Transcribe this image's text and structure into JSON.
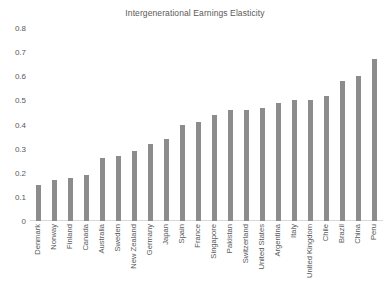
{
  "chart_data": {
    "type": "bar",
    "title": "Intergenerational Earnings Elasticity",
    "xlabel": "",
    "ylabel": "",
    "ylim": [
      0,
      0.8
    ],
    "yticks": [
      "0",
      "0.1",
      "0.2",
      "0.3",
      "0.4",
      "0.5",
      "0.6",
      "0.7",
      "0.8"
    ],
    "ytick_values": [
      0,
      0.1,
      0.2,
      0.3,
      0.4,
      0.5,
      0.6,
      0.7,
      0.8
    ],
    "grid": false,
    "legend": false,
    "bar_color": "#8c8c8c",
    "categories": [
      "Denmark",
      "Norway",
      "Finland",
      "Canada",
      "Australia",
      "Sweden",
      "New Zealand",
      "Germany",
      "Japan",
      "Spain",
      "France",
      "Singapore",
      "Pakistan",
      "Switzerland",
      "United States",
      "Argentina",
      "Italy",
      "United Kingdom",
      "Chile",
      "Brazil",
      "China",
      "Peru"
    ],
    "values": [
      0.15,
      0.17,
      0.18,
      0.19,
      0.26,
      0.27,
      0.29,
      0.32,
      0.34,
      0.4,
      0.41,
      0.44,
      0.46,
      0.46,
      0.47,
      0.49,
      0.5,
      0.5,
      0.52,
      0.58,
      0.6,
      0.67
    ]
  }
}
